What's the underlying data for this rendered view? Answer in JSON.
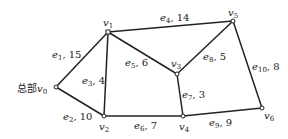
{
  "graph": {
    "nodes": [
      {
        "id": "v0",
        "name": "v",
        "sub": "0",
        "prefix": "总部",
        "x": 56,
        "y": 87
      },
      {
        "id": "v1",
        "name": "v",
        "sub": "1",
        "prefix": "",
        "x": 108,
        "y": 32
      },
      {
        "id": "v2",
        "name": "v",
        "sub": "2",
        "prefix": "",
        "x": 104,
        "y": 116
      },
      {
        "id": "v3",
        "name": "v",
        "sub": "3",
        "prefix": "",
        "x": 177,
        "y": 74
      },
      {
        "id": "v4",
        "name": "v",
        "sub": "4",
        "prefix": "",
        "x": 183,
        "y": 116
      },
      {
        "id": "v5",
        "name": "v",
        "sub": "5",
        "prefix": "",
        "x": 233,
        "y": 21
      },
      {
        "id": "v6",
        "name": "v",
        "sub": "6",
        "prefix": "",
        "x": 262,
        "y": 108
      }
    ],
    "edges": [
      {
        "id": "e1",
        "sub": "1",
        "weight": "15",
        "from": "v0",
        "to": "v1"
      },
      {
        "id": "e2",
        "sub": "2",
        "weight": "10",
        "from": "v0",
        "to": "v2"
      },
      {
        "id": "e3",
        "sub": "3",
        "weight": "4",
        "from": "v1",
        "to": "v2"
      },
      {
        "id": "e4",
        "sub": "4",
        "weight": "14",
        "from": "v1",
        "to": "v5"
      },
      {
        "id": "e5",
        "sub": "5",
        "weight": "6",
        "from": "v1",
        "to": "v3"
      },
      {
        "id": "e6",
        "sub": "6",
        "weight": "7",
        "from": "v2",
        "to": "v4"
      },
      {
        "id": "e7",
        "sub": "7",
        "weight": "3",
        "from": "v3",
        "to": "v4"
      },
      {
        "id": "e8",
        "sub": "8",
        "weight": "5",
        "from": "v3",
        "to": "v5"
      },
      {
        "id": "e9",
        "sub": "9",
        "weight": "9",
        "from": "v4",
        "to": "v6"
      },
      {
        "id": "e10",
        "sub": "10",
        "weight": "8",
        "from": "v5",
        "to": "v6"
      }
    ]
  }
}
